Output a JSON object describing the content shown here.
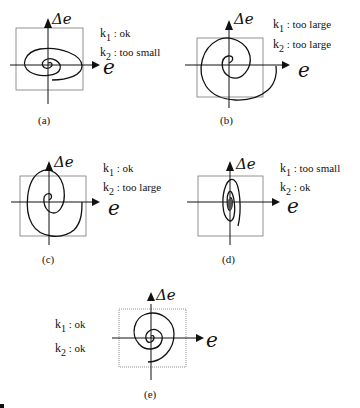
{
  "figure": {
    "panels": [
      {
        "id": "a",
        "caption": "(a)",
        "y_axis_label": "Δe",
        "x_axis_label": "e",
        "k1_label": "k",
        "k1_sub": "1",
        "k1_value": " : ok",
        "k2_label": "k",
        "k2_sub": "2",
        "k2_value": " : too small"
      },
      {
        "id": "b",
        "caption": "(b)",
        "y_axis_label": "Δe",
        "x_axis_label": "e",
        "k1_label": "k",
        "k1_sub": "1",
        "k1_value": " : too large",
        "k2_label": "k",
        "k2_sub": "2",
        "k2_value": " : too large"
      },
      {
        "id": "c",
        "caption": "(c)",
        "y_axis_label": "Δe",
        "x_axis_label": "e",
        "k1_label": "k",
        "k1_sub": "1",
        "k1_value": " : ok",
        "k2_label": "k",
        "k2_sub": "2",
        "k2_value": " : too large"
      },
      {
        "id": "d",
        "caption": "(d)",
        "y_axis_label": "Δe",
        "x_axis_label": "e",
        "k1_label": "k",
        "k1_sub": "1",
        "k1_value": " : too small",
        "k2_label": "k",
        "k2_sub": "2",
        "k2_value": " : ok"
      },
      {
        "id": "e",
        "caption": "(e)",
        "y_axis_label": "Δe",
        "x_axis_label": "e",
        "k1_label": "k",
        "k1_sub": "1",
        "k1_value": " : ok",
        "k2_label": "k",
        "k2_sub": "2",
        "k2_value": " : ok"
      }
    ],
    "colors": {
      "stroke": "#111111",
      "box": "#777777"
    }
  }
}
